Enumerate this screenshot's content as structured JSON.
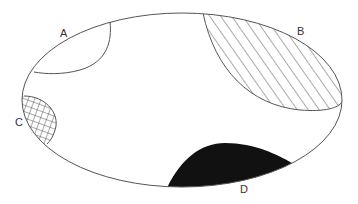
{
  "diagram": {
    "type": "ellipse-with-regions",
    "outline_color": "#555555",
    "regions": [
      {
        "id": "A",
        "label": "A",
        "fill": "none",
        "pattern": "empty"
      },
      {
        "id": "B",
        "label": "B",
        "fill": "hatch",
        "pattern": "diagonal-lines"
      },
      {
        "id": "C",
        "label": "C",
        "fill": "crosshatch",
        "pattern": "grid"
      },
      {
        "id": "D",
        "label": "D",
        "fill": "#111111",
        "pattern": "solid-black"
      }
    ]
  }
}
